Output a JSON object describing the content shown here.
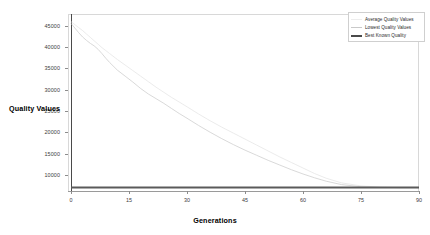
{
  "chart_data": {
    "type": "line",
    "title": "",
    "xlabel": "Generations",
    "ylabel": "Quality Values",
    "xlim": [
      0,
      90
    ],
    "ylim": [
      6200,
      47800
    ],
    "grid": false,
    "legend_position": "top-right",
    "xticks": [
      "0",
      "15",
      "30",
      "45",
      "60",
      "75",
      "90"
    ],
    "xtick_values": [
      0,
      15,
      30,
      45,
      60,
      75,
      90
    ],
    "yticks": [
      "10000",
      "15000",
      "20000",
      "25000",
      "30000",
      "35000",
      "40000",
      "45000"
    ],
    "ytick_values": [
      10000,
      15000,
      20000,
      25000,
      30000,
      35000,
      40000,
      45000
    ],
    "series": [
      {
        "name": "Average Quality Values",
        "color": "#e2e2e2",
        "x": [
          0,
          1,
          2,
          3,
          4,
          5,
          6,
          7,
          8,
          9,
          10,
          12,
          14,
          16,
          18,
          20,
          22,
          24,
          26,
          28,
          30,
          33,
          36,
          39,
          42,
          45,
          48,
          51,
          54,
          57,
          60,
          63,
          66,
          70,
          75,
          80,
          85,
          90
        ],
        "values": [
          46000,
          45300,
          44600,
          43900,
          43100,
          42300,
          41500,
          40700,
          39900,
          39200,
          38500,
          37100,
          35800,
          34500,
          33200,
          31900,
          30600,
          29400,
          28200,
          27100,
          26000,
          24300,
          22700,
          21200,
          19800,
          18400,
          17000,
          15600,
          14200,
          12900,
          11600,
          10300,
          9200,
          8100,
          7400,
          7100,
          7000,
          7000
        ]
      },
      {
        "name": "Lowest Quality Values",
        "color": "#cfcfcf",
        "x": [
          0,
          1,
          2,
          3,
          4,
          5,
          6,
          7,
          8,
          9,
          10,
          12,
          14,
          16,
          18,
          20,
          22,
          24,
          26,
          28,
          30,
          33,
          36,
          39,
          42,
          45,
          48,
          51,
          54,
          57,
          60,
          63,
          66,
          70,
          75,
          80,
          85,
          90
        ],
        "values": [
          45600,
          44500,
          43400,
          42400,
          41600,
          40900,
          40300,
          39500,
          38500,
          37400,
          36400,
          34600,
          33200,
          31800,
          30300,
          29000,
          27900,
          26800,
          25600,
          24400,
          23300,
          21600,
          20000,
          18500,
          17100,
          15800,
          14600,
          13400,
          12300,
          11200,
          10200,
          9300,
          8500,
          7700,
          7200,
          7050,
          7000,
          7000
        ]
      },
      {
        "name": "Best Known Quality",
        "color": "#5a5a5a",
        "x": [
          0,
          90
        ],
        "values": [
          7000,
          7000
        ]
      }
    ]
  },
  "legend": {
    "entries": [
      {
        "label": "Average Quality Values",
        "color": "#ededed",
        "width": 0.7
      },
      {
        "label": "Lowest Quality Values",
        "color": "#c9c9c9",
        "width": 0.9
      },
      {
        "label": "Best Known Quality",
        "color": "#4a4a4a",
        "width": 1.8
      }
    ]
  }
}
